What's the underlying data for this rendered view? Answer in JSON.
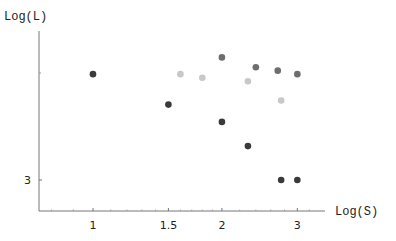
{
  "chart_data": {
    "type": "scatter",
    "title": "",
    "xlabel": "Log(S)",
    "ylabel": "Log(L)",
    "x_scale": "log",
    "y_scale": "log",
    "x_ticks": [
      1,
      1.5,
      2,
      3
    ],
    "x_tick_labels": [
      "1",
      "1.5",
      "2",
      "3"
    ],
    "y_ticks": [
      3
    ],
    "y_tick_labels": [
      "3"
    ],
    "xlim": [
      0.75,
      3.45
    ],
    "ylim": [
      2.5,
      7.5
    ],
    "grid": false,
    "legend": null,
    "series": [
      {
        "name": "dark",
        "color": "#3a3a3a",
        "points": [
          [
            1.0,
            5.3
          ],
          [
            1.5,
            4.5
          ],
          [
            2.0,
            4.1
          ],
          [
            2.3,
            3.6
          ],
          [
            2.75,
            3.0
          ],
          [
            3.0,
            3.0
          ]
        ]
      },
      {
        "name": "light",
        "color": "#c8c8c8",
        "points": [
          [
            1.6,
            5.3
          ],
          [
            1.8,
            5.2
          ],
          [
            2.3,
            5.1
          ],
          [
            2.75,
            4.6
          ]
        ]
      },
      {
        "name": "medium",
        "color": "#6e6e6e",
        "points": [
          [
            2.0,
            5.8
          ],
          [
            2.4,
            5.5
          ],
          [
            2.7,
            5.4
          ],
          [
            3.0,
            5.3
          ]
        ]
      }
    ]
  },
  "layout": {
    "origin_px": [
      39,
      211
    ],
    "x_axis_end_px": 325,
    "y_axis_top_px": 31,
    "x_px_per_ln": 186,
    "x_ref": {
      "value": 1,
      "px": 93
    },
    "y_px_per_ln": 186,
    "y_ref": {
      "value": 3,
      "px": 180
    },
    "y_extra_tick_px": 73,
    "point_radius": 3.3
  }
}
